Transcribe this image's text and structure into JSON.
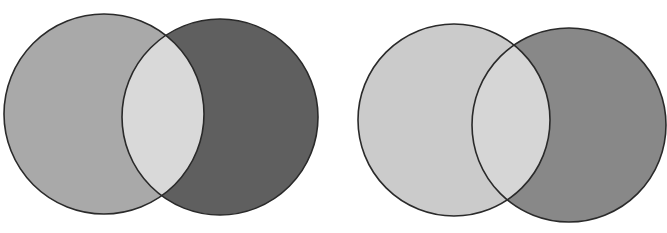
{
  "figure": {
    "background": "#ffffff",
    "stroke_color": "#2a2a2a",
    "stroke_width": 1.6,
    "diagrams": [
      {
        "name": "venn-left",
        "left_circle": {
          "cx": 104,
          "cy": 114,
          "r": 100,
          "fill": "#a9a9a9"
        },
        "right_circle": {
          "cx": 220,
          "cy": 117,
          "r": 98,
          "fill": "#5f5f5f"
        },
        "intersection_fill": "#d9d9d9"
      },
      {
        "name": "venn-right",
        "left_circle": {
          "cx": 454,
          "cy": 120,
          "r": 96,
          "fill": "#cbcbcb"
        },
        "right_circle": {
          "cx": 569,
          "cy": 125,
          "r": 97,
          "fill": "#888888"
        },
        "intersection_fill": "#d6d6d6"
      }
    ]
  }
}
